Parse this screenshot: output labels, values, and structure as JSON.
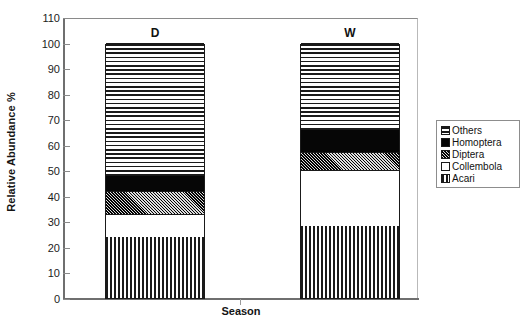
{
  "chart_data": {
    "type": "bar",
    "subtype": "stacked-bar-100",
    "title": "",
    "xlabel": "Season",
    "ylabel": "Relative Abundance %",
    "categories": [
      "D",
      "W"
    ],
    "ylim": [
      0,
      110
    ],
    "ytick_labels": [
      "0",
      "10",
      "20",
      "30",
      "40",
      "50",
      "60",
      "70",
      "80",
      "90",
      "100",
      "110"
    ],
    "ytick_values": [
      0,
      10,
      20,
      30,
      40,
      50,
      60,
      70,
      80,
      90,
      100,
      110
    ],
    "grid": false,
    "legend_position": "right",
    "stack_order_bottom_to_top": [
      "Acari",
      "Collembola",
      "Diptera",
      "Homoptera",
      "Others"
    ],
    "series": [
      {
        "name": "Others",
        "pattern": "horizontal-lines",
        "values": [
          52,
          34
        ]
      },
      {
        "name": "Homoptera",
        "pattern": "solid-black",
        "values": [
          6,
          9
        ]
      },
      {
        "name": "Diptera",
        "pattern": "crosshatch",
        "values": [
          9,
          7
        ]
      },
      {
        "name": "Collembola",
        "pattern": "white",
        "values": [
          9,
          22
        ]
      },
      {
        "name": "Acari",
        "pattern": "vertical-lines",
        "values": [
          24,
          28
        ]
      }
    ],
    "bar_totals": [
      100,
      100
    ]
  },
  "legend": {
    "items": [
      {
        "label": "Others",
        "pattern": "horizontal-lines"
      },
      {
        "label": "Homoptera",
        "pattern": "solid-black"
      },
      {
        "label": "Diptera",
        "pattern": "crosshatch"
      },
      {
        "label": "Collembola",
        "pattern": "white"
      },
      {
        "label": "Acari",
        "pattern": "vertical-lines"
      }
    ]
  },
  "axes": {
    "y_title": "Relative Abundance %",
    "x_title": "Season",
    "y_ticks": [
      "110",
      "100",
      "90",
      "80",
      "70",
      "60",
      "50",
      "40",
      "30",
      "20",
      "10",
      "0"
    ]
  },
  "bar_labels": [
    "D",
    "W"
  ]
}
